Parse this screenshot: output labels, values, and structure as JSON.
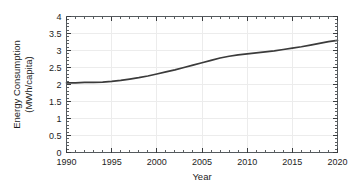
{
  "chart_data": {
    "type": "line",
    "title": "",
    "xlabel": "Year",
    "ylabel": "Energy Consumption (MWh/capita)",
    "ylabel_line1": "Energy Consumption",
    "ylabel_line2": "(MWh/capita)",
    "xlim": [
      1990,
      2020
    ],
    "ylim": [
      0,
      4
    ],
    "grid": true,
    "legend": false,
    "legend_position": "none",
    "line_color": "#3b3b3b",
    "frame_color": "#555a5e",
    "grid_color": "#ececec",
    "background_color": "#ffffff",
    "x_ticks": [
      1990,
      1995,
      2000,
      2005,
      2010,
      2015,
      2020
    ],
    "x_tick_labels": [
      "1990",
      "1995",
      "2000",
      "2005",
      "2010",
      "2015",
      "2020"
    ],
    "x_minor_interval": 1,
    "y_ticks": [
      0,
      0.5,
      1,
      1.5,
      2,
      2.5,
      3,
      3.5,
      4
    ],
    "y_tick_labels": [
      "0",
      "0.5",
      "1",
      "1.5",
      "2",
      "2.5",
      "3",
      "3.5",
      "4"
    ],
    "y_minor_interval": 0.1,
    "series": [
      {
        "name": "Energy Consumption",
        "color": "#3b3b3b",
        "x": [
          1990,
          1991,
          1992,
          1993,
          1994,
          1995,
          1996,
          1997,
          1998,
          1999,
          2000,
          2001,
          2002,
          2003,
          2004,
          2005,
          2006,
          2007,
          2008,
          2009,
          2010,
          2011,
          2012,
          2013,
          2014,
          2015,
          2016,
          2017,
          2018,
          2019,
          2020
        ],
        "y": [
          2.05,
          2.05,
          2.06,
          2.06,
          2.07,
          2.09,
          2.12,
          2.16,
          2.2,
          2.25,
          2.31,
          2.37,
          2.43,
          2.5,
          2.57,
          2.64,
          2.71,
          2.78,
          2.83,
          2.87,
          2.9,
          2.93,
          2.96,
          2.99,
          3.03,
          3.07,
          3.11,
          3.16,
          3.21,
          3.26,
          3.3
        ]
      }
    ]
  }
}
